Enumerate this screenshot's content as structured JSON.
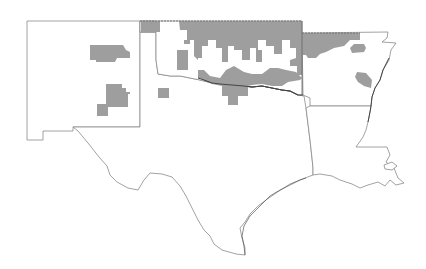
{
  "map": {
    "type": "choropleth",
    "region": "South Central United States",
    "states": [
      "New Mexico",
      "Texas",
      "Oklahoma",
      "Arkansas",
      "Louisiana"
    ],
    "colors": {
      "background": "#ffffff",
      "boundary": "#8a8a8a",
      "highlighted_area": "#9e9e9e"
    },
    "legend": null,
    "title": null
  }
}
